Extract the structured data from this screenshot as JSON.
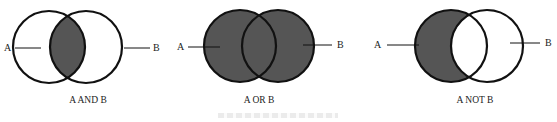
{
  "diagrams": [
    {
      "caption": "A AND B",
      "left_label": "A",
      "right_label": "B",
      "shaded": "intersection"
    },
    {
      "caption": "A OR B",
      "left_label": "A",
      "right_label": "B",
      "shaded": "union"
    },
    {
      "caption": "A NOT B",
      "left_label": "A",
      "right_label": "B",
      "shaded": "left-only"
    }
  ],
  "colors": {
    "fill": "#555555",
    "stroke": "#111111",
    "background": "#ffffff"
  }
}
